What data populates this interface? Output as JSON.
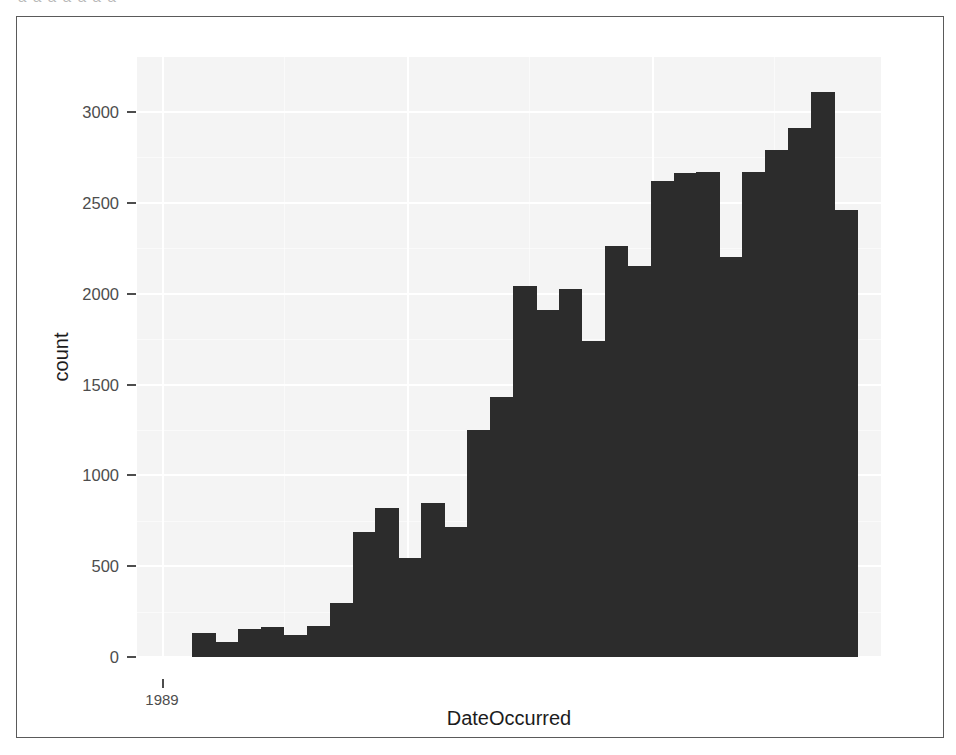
{
  "figure": {
    "top_bleed_text": "a  a    a   a         a       a          a"
  },
  "chart_data": {
    "type": "bar",
    "title": "",
    "subtitle": "",
    "xlabel": "DateOccurred",
    "ylabel": "count",
    "grid": true,
    "legend": null,
    "ylim": [
      0,
      3150
    ],
    "y_ticks": [
      0,
      500,
      1000,
      1500,
      2000,
      2500,
      3000
    ],
    "y_tick_labels": [
      "0",
      "500",
      "1000",
      "1500",
      "2000",
      "2500",
      "3000"
    ],
    "y_minor_ticks": [
      250,
      750,
      1250,
      1750,
      2250,
      2750
    ],
    "x_ticks": [
      "1989"
    ],
    "x_tick_labels": [
      "1989"
    ],
    "bar_color": "#2c2c2c",
    "panel_color": "#f4f4f4",
    "grid_color": "#ffffff",
    "bin_count": 29,
    "categories": [
      "bin-01",
      "bin-02",
      "bin-03",
      "bin-04",
      "bin-05",
      "bin-06",
      "bin-07",
      "bin-08",
      "bin-09",
      "bin-10",
      "bin-11",
      "bin-12",
      "bin-13",
      "bin-14",
      "bin-15",
      "bin-16",
      "bin-17",
      "bin-18",
      "bin-19",
      "bin-20",
      "bin-21",
      "bin-22",
      "bin-23",
      "bin-24",
      "bin-25",
      "bin-26",
      "bin-27",
      "bin-28",
      "bin-29"
    ],
    "values": [
      130,
      85,
      155,
      165,
      120,
      170,
      300,
      690,
      820,
      545,
      850,
      715,
      1250,
      1430,
      2045,
      1910,
      2025,
      1740,
      2260,
      2150,
      2620,
      2665,
      2670,
      2200,
      2670,
      2790,
      2910,
      3110,
      2460
    ]
  }
}
